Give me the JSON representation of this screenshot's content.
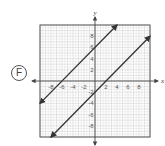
{
  "option": {
    "label": "F"
  },
  "chart_data": {
    "type": "line",
    "title": "",
    "xlabel": "x",
    "ylabel": "y",
    "xlim": [
      -10,
      10
    ],
    "ylim": [
      -10,
      10
    ],
    "grid": true,
    "x_ticks": [
      -8,
      -6,
      -4,
      -2,
      2,
      4,
      6,
      8
    ],
    "y_ticks": [
      -8,
      -6,
      -4,
      -2,
      2,
      4,
      6,
      8
    ],
    "series": [
      {
        "name": "line 1",
        "equation": "y = x + 6",
        "slope": 1,
        "intercept": 6,
        "x": [
          -10,
          4
        ],
        "y": [
          -4,
          10
        ],
        "arrows": "both"
      },
      {
        "name": "line 2",
        "equation": "y = x - 2",
        "slope": 1,
        "intercept": -2,
        "x": [
          -8,
          10
        ],
        "y": [
          -10,
          8
        ],
        "arrows": "both"
      }
    ],
    "line_color": "#333333",
    "grid_color": "#cccccc"
  }
}
